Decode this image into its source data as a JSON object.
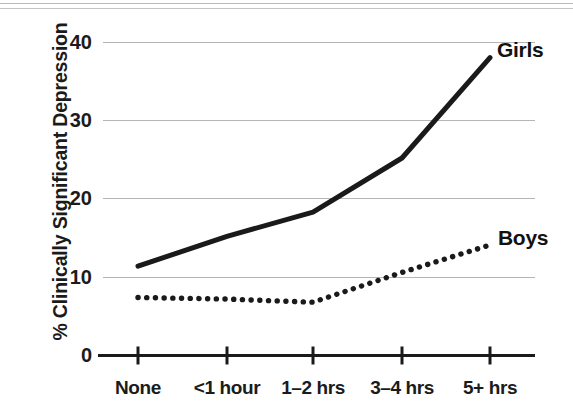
{
  "chart_data": {
    "type": "line",
    "title": "",
    "subtitle": "",
    "xlabel": "",
    "ylabel": "% Clinically Significant Depression",
    "categories": [
      "None",
      "<1 hour",
      "1–2 hrs",
      "3–4 hrs",
      "5+ hrs"
    ],
    "series": [
      {
        "name": "Girls",
        "values": [
          11.4,
          15.2,
          18.3,
          25.2,
          38.0
        ],
        "style": "solid",
        "color": "#1a1a1a",
        "label_position": "right-end"
      },
      {
        "name": "Boys",
        "values": [
          7.4,
          7.2,
          6.8,
          10.6,
          14.1
        ],
        "style": "dotted",
        "color": "#1a1a1a",
        "label_position": "right-end"
      }
    ],
    "ylim": [
      0,
      40
    ],
    "yticks": [
      0,
      10,
      20,
      30,
      40
    ],
    "ytick_labels": [
      "0",
      "10",
      "20",
      "30",
      "40"
    ],
    "grid": true,
    "grid_axis": "y",
    "grid_color": "#b5b5b5",
    "legend": "inline-end-labels",
    "legend_position": "right",
    "annotations": []
  },
  "axes": {
    "y_title": "% Clinically Significant Depression",
    "y_ticks": [
      {
        "label": "40",
        "value": 40
      },
      {
        "label": "30",
        "value": 30
      },
      {
        "label": "20",
        "value": 20
      },
      {
        "label": "10",
        "value": 10
      },
      {
        "label": "0",
        "value": 0
      }
    ],
    "x_ticks": [
      {
        "label": "None"
      },
      {
        "label": "<1 hour"
      },
      {
        "label": "1–2 hrs"
      },
      {
        "label": "3–4 hrs"
      },
      {
        "label": "5+ hrs"
      }
    ]
  },
  "series_labels": {
    "girls": "Girls",
    "boys": "Boys"
  },
  "colors": {
    "ink": "#1a1a1a",
    "grid": "#b5b5b5",
    "background": "#ffffff",
    "scan_artifact": "#b9b9b9"
  }
}
